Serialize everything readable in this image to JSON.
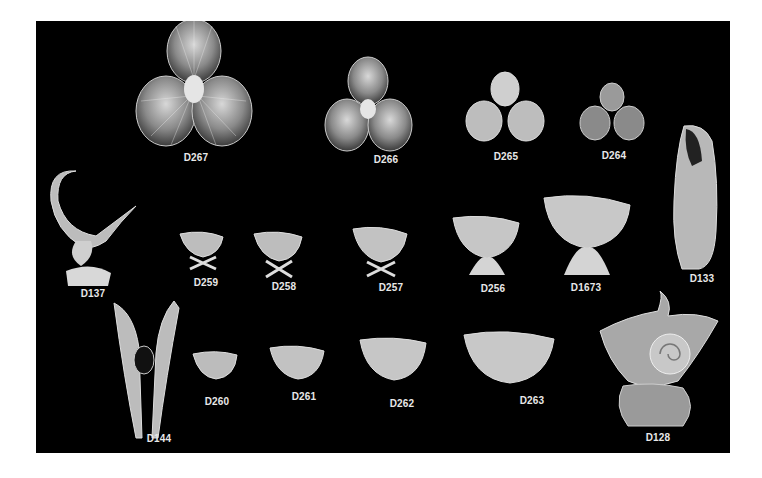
{
  "catalog": {
    "background_color": "#000000",
    "page_color": "#ffffff",
    "label_color": "#e8e8e8",
    "items": [
      {
        "code": "D267",
        "type": "triple-scallop-shell-dish",
        "size": "large"
      },
      {
        "code": "D266",
        "type": "triple-scallop-shell-dish",
        "size": "medium"
      },
      {
        "code": "D265",
        "type": "triple-scallop-shell-dish",
        "size": "small"
      },
      {
        "code": "D264",
        "type": "triple-scallop-shell-dish",
        "size": "smallest"
      },
      {
        "code": "D137",
        "type": "cornucopia-shell-vase"
      },
      {
        "code": "D259",
        "type": "nautilus-shell-salt-on-crossed-stand"
      },
      {
        "code": "D258",
        "type": "nautilus-shell-salt-on-crossed-stand"
      },
      {
        "code": "D257",
        "type": "nautilus-shell-salt-on-crossed-stand"
      },
      {
        "code": "D256",
        "type": "nautilus-shell-dish-on-coral-stand"
      },
      {
        "code": "D1673",
        "type": "nautilus-shell-dish-on-coral-stand"
      },
      {
        "code": "D133",
        "type": "spiral-shell-vase"
      },
      {
        "code": "D144",
        "type": "double-horn-shell-vase"
      },
      {
        "code": "D260",
        "type": "footed-shell-dish"
      },
      {
        "code": "D261",
        "type": "footed-shell-dish"
      },
      {
        "code": "D262",
        "type": "footed-shell-dish"
      },
      {
        "code": "D263",
        "type": "footed-shell-dish"
      },
      {
        "code": "D128",
        "type": "nautilus-shell-centerpiece-on-scroll-base"
      }
    ]
  }
}
